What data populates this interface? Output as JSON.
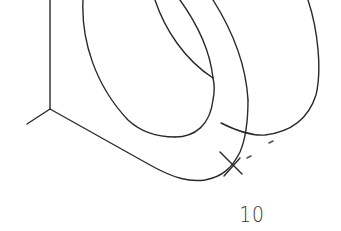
{
  "figure": {
    "label": "10",
    "stroke_color": "#2a2a2a",
    "background": "#ffffff"
  }
}
